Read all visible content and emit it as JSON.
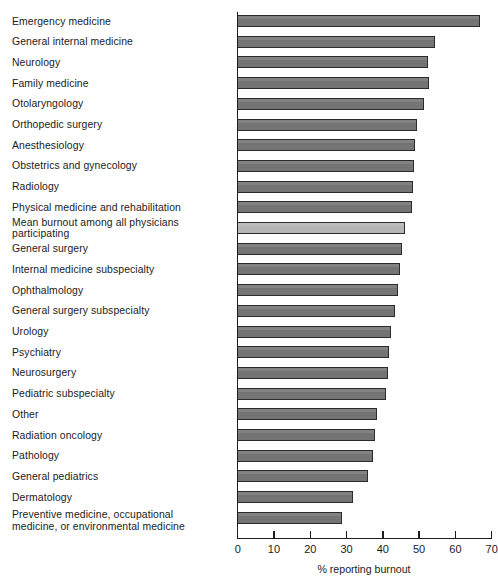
{
  "chart_data": {
    "type": "bar",
    "orientation": "horizontal",
    "title": "",
    "xlabel": "% reporting burnout",
    "ylabel": "",
    "xlim": [
      0,
      70
    ],
    "xticks": [
      0,
      10,
      20,
      30,
      40,
      50,
      60,
      70
    ],
    "grid": false,
    "legend": null,
    "bar_color": "#747474",
    "highlight_color": "#b6b6b6",
    "border_color": "#2b2b2b",
    "highlight_category": "Mean burnout among all physicians participating",
    "categories": [
      "Emergency medicine",
      "General internal medicine",
      "Neurology",
      "Family medicine",
      "Otolaryngology",
      "Orthopedic surgery",
      "Anesthesiology",
      "Obstetrics and gynecology",
      "Radiology",
      "Physical medicine and rehabilitation",
      "Mean burnout among all physicians participating",
      "General surgery",
      "Internal medicine subspecialty",
      "Ophthalmology",
      "General surgery subspecialty",
      "Urology",
      "Psychiatry",
      "Neurosurgery",
      "Pediatric subspecialty",
      "Other",
      "Radiation oncology",
      "Pathology",
      "General pediatrics",
      "Dermatology",
      "Preventive medicine, occupational\nmedicine, or environmental medicine"
    ],
    "values": [
      67.0,
      54.5,
      52.5,
      53.0,
      51.5,
      49.5,
      49.0,
      48.7,
      48.5,
      48.2,
      46.3,
      45.5,
      45.0,
      44.5,
      43.5,
      42.5,
      42.0,
      41.5,
      41.0,
      38.5,
      38.0,
      37.5,
      36.0,
      32.0,
      29.0
    ]
  }
}
